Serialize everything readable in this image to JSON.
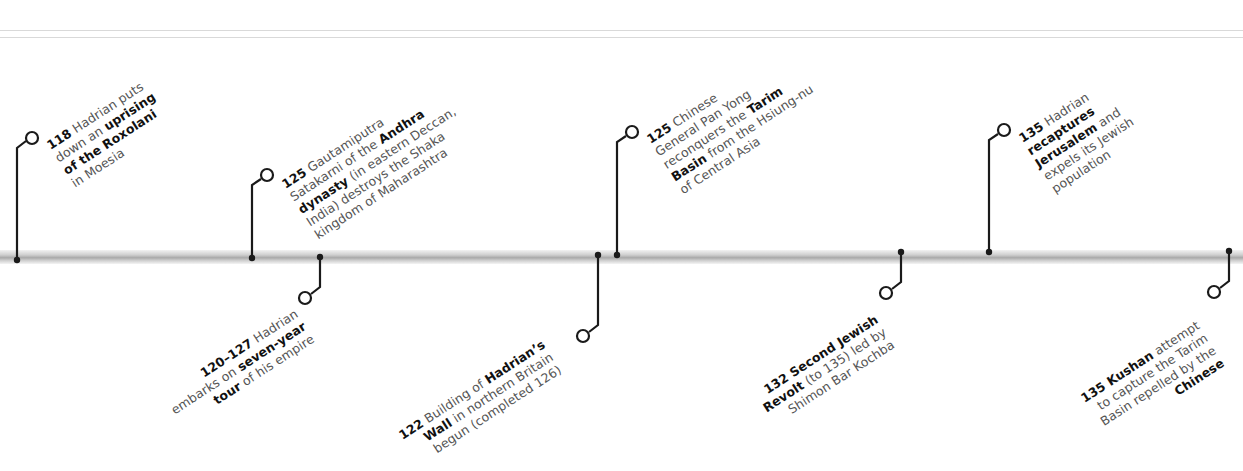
{
  "timeline": {
    "colors": {
      "connector": "#1a1a1a",
      "body_text": "#555555",
      "bold_text": "#111111",
      "bar": "#bdbdbd",
      "rule": "#d9d9d9"
    },
    "events_above": [
      {
        "year": "118",
        "lines": [
          {
            "bold": "118",
            "text": " Hadrian puts"
          },
          {
            "text": "down an ",
            "bold2": "uprising"
          },
          {
            "bold": "of the Roxolani"
          },
          {
            "text": "in Moesia"
          }
        ]
      },
      {
        "year": "125",
        "lines": [
          {
            "bold": "125",
            "text": " Gautamiputra"
          },
          {
            "text": "Satakarni of the ",
            "bold2": "Andhra"
          },
          {
            "bold": "dynasty",
            "text": " (in eastern Deccan,"
          },
          {
            "text": "India) destroys the Shaka"
          },
          {
            "text": "kingdom of Maharashtra"
          }
        ]
      },
      {
        "year": "125",
        "lines": [
          {
            "bold": "125",
            "text": " Chinese"
          },
          {
            "text": "General Pan Yong"
          },
          {
            "text": "reconquers the ",
            "bold2": "Tarim"
          },
          {
            "bold": "Basin",
            "text": " from the Hsiung-nu"
          },
          {
            "text": "of Central Asia"
          }
        ]
      },
      {
        "year": "135",
        "lines": [
          {
            "bold": "135",
            "text": " Hadrian"
          },
          {
            "bold": "recaptures"
          },
          {
            "bold": "Jerusalem",
            "text": " and"
          },
          {
            "text": "expels its Jewish"
          },
          {
            "text": "population"
          }
        ]
      }
    ],
    "events_below": [
      {
        "year": "120–127",
        "lines": [
          {
            "bold": "120–127",
            "text": " Hadrian"
          },
          {
            "text": "embarks on ",
            "bold2": "seven-year"
          },
          {
            "bold": "tour",
            "text": " of his empire"
          }
        ]
      },
      {
        "year": "122",
        "lines": [
          {
            "bold": "122",
            "text": " Building of ",
            "bold2": "Hadrian’s"
          },
          {
            "bold": "Wall",
            "text": " in northern Britain"
          },
          {
            "text": "begun (completed 126)"
          }
        ]
      },
      {
        "year": "132",
        "lines": [
          {
            "bold": "132 Second Jewish"
          },
          {
            "bold": "Revolt",
            "text": " (to 135) led by"
          },
          {
            "text": "Shimon Bar Kochba"
          }
        ]
      },
      {
        "year": "135",
        "lines": [
          {
            "bold": "135 Kushan",
            "text": " attempt"
          },
          {
            "text": "to capture the Tarim"
          },
          {
            "text": "Basin repelled by the"
          },
          {
            "bold": "Chinese"
          }
        ]
      }
    ]
  }
}
